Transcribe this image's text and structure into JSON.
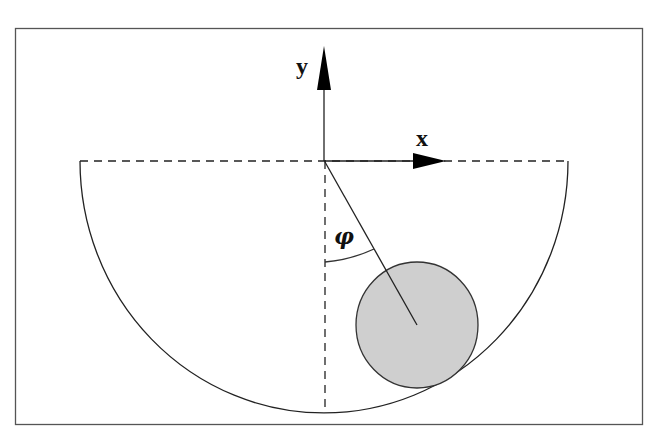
{
  "diagram": {
    "title": "",
    "labels": {
      "y_axis": "y",
      "x_axis": "x",
      "angle": "φ"
    },
    "elements": [
      {
        "type": "frame",
        "desc": "rectangular border"
      },
      {
        "type": "semicircular-trough",
        "desc": "half-circle bowl with dashed top diameter"
      },
      {
        "type": "axis",
        "name": "y",
        "direction": "up"
      },
      {
        "type": "axis",
        "name": "x",
        "direction": "right"
      },
      {
        "type": "dashed-line",
        "desc": "vertical dashed reference line from origin to bottom"
      },
      {
        "type": "radius-line",
        "desc": "line from origin through ball center"
      },
      {
        "type": "angle-arc",
        "label": "φ"
      },
      {
        "type": "ball",
        "desc": "gray circle resting on inner surface",
        "fill": "#cfcfcf"
      }
    ],
    "colors": {
      "stroke": "#222222",
      "ball_fill": "#cfcfcf",
      "background": "#ffffff"
    }
  }
}
